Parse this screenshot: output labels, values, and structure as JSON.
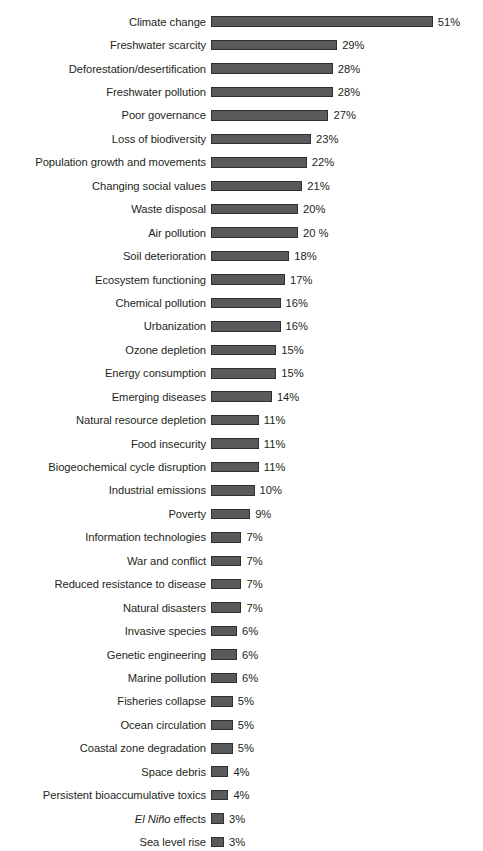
{
  "chart_data": {
    "type": "bar",
    "orientation": "horizontal",
    "title": "",
    "subtitle": "",
    "xlabel": "",
    "ylabel": "",
    "xlim": [
      0,
      51
    ],
    "grid": false,
    "legend": null,
    "bar_color": "#5a5a5a",
    "bar_outline_color": "#2f2f2f",
    "text_color": "#231f20",
    "background": "#ffffff",
    "categories": [
      "Climate change",
      "Freshwater scarcity",
      "Deforestation/desertification",
      "Freshwater pollution",
      "Poor governance",
      "Loss of biodiversity",
      "Population growth and movements",
      "Changing social values",
      "Waste disposal",
      "Air pollution",
      "Soil deterioration",
      "Ecosystem functioning",
      "Chemical pollution",
      "Urbanization",
      "Ozone depletion",
      "Energy consumption",
      "Emerging diseases",
      "Natural resource depletion",
      "Food insecurity",
      "Biogeochemical cycle disruption",
      "Industrial emissions",
      "Poverty",
      "Information technologies",
      "War and conflict",
      "Reduced resistance to disease",
      "Natural disasters",
      "Invasive species",
      "Genetic engineering",
      "Marine pollution",
      "Fisheries collapse",
      "Ocean circulation",
      "Coastal zone degradation",
      "Space debris",
      "Persistent bioaccumulative toxics",
      "El Niño effects",
      "Sea level rise"
    ],
    "values": [
      51,
      29,
      28,
      28,
      27,
      23,
      22,
      21,
      20,
      20,
      18,
      17,
      16,
      16,
      15,
      15,
      14,
      11,
      11,
      11,
      10,
      9,
      7,
      7,
      7,
      7,
      6,
      6,
      6,
      5,
      5,
      5,
      4,
      4,
      3,
      3
    ],
    "value_labels": [
      "51%",
      "29%",
      "28%",
      "28%",
      "27%",
      "23%",
      "22%",
      "21%",
      "20%",
      "20 %",
      "18%",
      "17%",
      "16%",
      "16%",
      "15%",
      "15%",
      "14%",
      "11%",
      "11%",
      "11%",
      "10%",
      "9%",
      "7%",
      "7%",
      "7%",
      "7%",
      "6%",
      "6%",
      "6%",
      "5%",
      "5%",
      "5%",
      "4%",
      "4%",
      "3%",
      "3%"
    ],
    "italic_categories": [
      "El Niño effects"
    ]
  }
}
